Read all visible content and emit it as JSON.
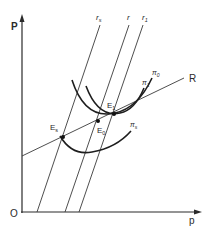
{
  "diagram": {
    "axes": {
      "y_label": "P",
      "x_label": "p",
      "origin_label": "O"
    },
    "lines": [
      {
        "id": "r_s",
        "label": "r",
        "sub": "s"
      },
      {
        "id": "r",
        "label": "r",
        "sub": ""
      },
      {
        "id": "r_1",
        "label": "r",
        "sub": "1"
      },
      {
        "id": "R",
        "label": "R",
        "sub": ""
      }
    ],
    "curves": [
      {
        "id": "pi_0",
        "label": "π",
        "sub": "0"
      },
      {
        "id": "pi_1",
        "label": "π",
        "sub": "1"
      },
      {
        "id": "pi_s",
        "label": "π",
        "sub": "s"
      }
    ],
    "points": [
      {
        "id": "E_s",
        "label": "E",
        "sub": "s"
      },
      {
        "id": "E_0",
        "label": "E",
        "sub": "0"
      },
      {
        "id": "E_1",
        "label": "E",
        "sub": "1"
      }
    ]
  }
}
